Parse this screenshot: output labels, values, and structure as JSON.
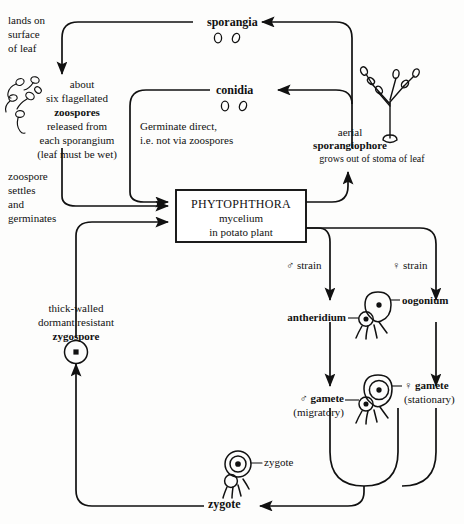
{
  "diagram": {
    "stroke_color": "#111111",
    "background_color": "#fdfdfc"
  },
  "center_box": {
    "genus": "PHYTOPHTHORA",
    "line2": "mycelium",
    "line3": "in potato plant"
  },
  "nodes": {
    "sporangia": "sporangia",
    "conidia": "conidia",
    "zoospores_line1": "about",
    "zoospores_line2": "six flagellated",
    "zoospores_bold": "zoospores",
    "zoospores_line4": "released from",
    "zoospores_line5": "each sporangium",
    "zoospores_line6": "(leaf must be wet)",
    "lands_line1": "lands on",
    "lands_line2": "surface",
    "lands_line3": "of leaf",
    "settles_line1": "zoospore",
    "settles_line2": "settles",
    "settles_line3": "and",
    "settles_line4": "germinates",
    "germinate_line1": "Germinate direct,",
    "germinate_line2": "i.e. not via zoospores",
    "sporangiophore_line1": "aerial",
    "sporangiophore_bold": "sporangiophore",
    "sporangiophore_line3": "grows out of stoma of leaf",
    "male_strain": "♂ strain",
    "female_strain": "♀ strain",
    "antheridium": "antheridium",
    "oogonium": "oogonium",
    "male_gamete_bold": "♂ gamete",
    "male_gamete_sub": "(migratory)",
    "female_gamete_bold": "♀ gamete",
    "female_gamete_sub": "(stationary)",
    "zygote_label_small": "zygote",
    "zygote_bold": "zygote",
    "zygospore_line1": "thick-walled",
    "zygospore_line2": "dormant resistant",
    "zygospore_bold": "zygospore"
  },
  "icons": {
    "sporangia_spores": "two-oval-spores-icon",
    "conidia_spores": "two-oval-spores-icon",
    "zoospore_cluster": "flagellated-zoospore-cluster-icon",
    "sporangiophore_tree": "branched-sporangiophore-icon",
    "oogonium_antheridium": "oogonium-antheridium-icon",
    "gamete_pair": "gamete-pair-icon",
    "zygote_cell": "zygote-cell-icon",
    "zygospore_cell": "zygospore-circle-icon"
  }
}
